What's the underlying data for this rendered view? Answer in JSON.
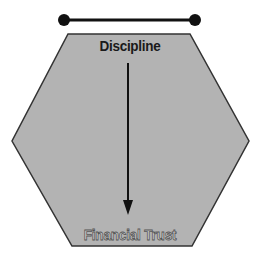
{
  "diagram": {
    "top_connector": {
      "left_dot": {
        "cx": 64,
        "cy": 20
      },
      "right_dot": {
        "cx": 195,
        "cy": 20
      },
      "color": "#111111"
    },
    "hexagon": {
      "fill": "#b3b3b3",
      "stroke": "#333333",
      "points": "68,34 190,34 249,141 192,246 72,246 12,141"
    },
    "top_label": "Discipline",
    "bottom_label": "Financial Trust",
    "arrow": {
      "from": "Discipline",
      "to": "Financial Trust",
      "direction": "down",
      "x": 128,
      "y1": 63,
      "y2": 215
    }
  }
}
